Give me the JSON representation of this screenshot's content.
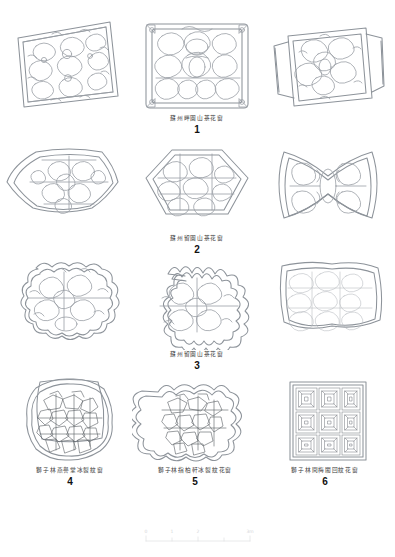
{
  "plate": {
    "title": "",
    "figure_count": 6
  },
  "figures": [
    {
      "number": "1",
      "caption": "蘇州畔園山茶花窗",
      "shape": "rectangular-panel",
      "views": [
        "perspective-left",
        "elevation-center",
        "perspective-right"
      ],
      "pattern": "ice-crack-cloud lattice"
    },
    {
      "number": "2",
      "caption": "蘇州留園山茶花窗",
      "shape": "star-fan-hourglass",
      "views": [
        "six-point-star",
        "hexagonal-fan",
        "hourglass"
      ],
      "pattern": "ice-crack-cloud lattice"
    },
    {
      "number": "3",
      "caption": "蘇州留園山茶花窗",
      "shape": "lobed-scalloped",
      "views": [
        "lobed-oval",
        "cusped-square",
        "irregular-square"
      ],
      "pattern": "ice-crack-cloud lattice"
    },
    {
      "number": "4",
      "caption": "獅子林燕譽堂冰裂紋窗",
      "shape": "rounded-square",
      "views": [
        "elevation"
      ],
      "pattern": "dense ice-crack"
    },
    {
      "number": "5",
      "caption": "獅子林指柏軒冰裂紋花窗",
      "shape": "cusped-scalloped",
      "views": [
        "elevation"
      ],
      "pattern": "dense ice-crack"
    },
    {
      "number": "6",
      "caption": "獅子林問梅閣回紋花窗",
      "shape": "square-grid",
      "views": [
        "elevation"
      ],
      "pattern": "3x3 fret (回紋) tiles"
    }
  ],
  "scale_bar": {
    "labels": [
      "0",
      "1",
      "2",
      "3m"
    ],
    "unit": "m"
  },
  "colors": {
    "line": "#9aa0a6",
    "line_dark": "#5d6166",
    "background": "#ffffff",
    "text": "#2b2b2b"
  }
}
